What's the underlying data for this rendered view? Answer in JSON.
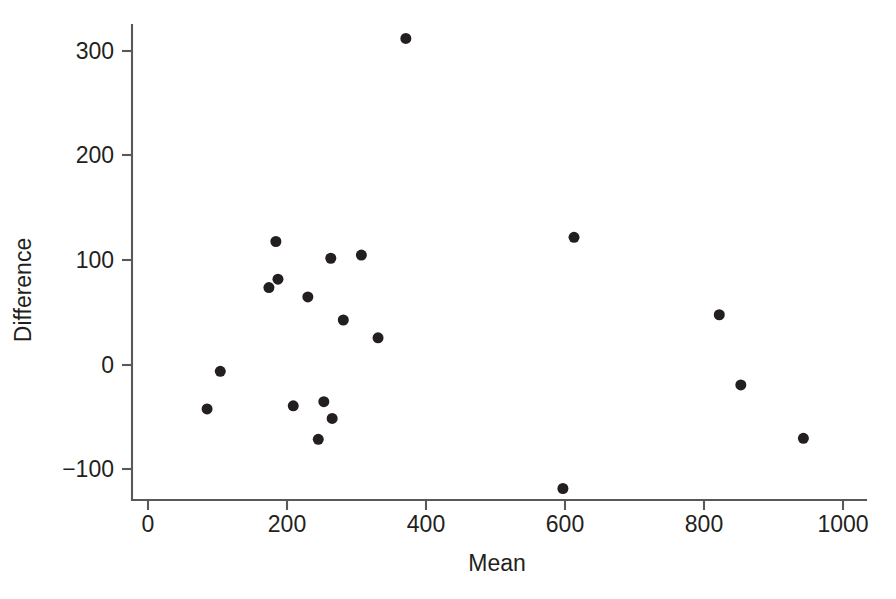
{
  "chart_data": {
    "type": "scatter",
    "title": "",
    "xlabel": "Mean",
    "ylabel": "Difference",
    "xlim": [
      -20,
      1060
    ],
    "ylim": [
      -145,
      330
    ],
    "grid": false,
    "legend": null,
    "x_ticks": [
      0,
      200,
      400,
      600,
      800,
      1000
    ],
    "x_tick_labels": [
      "0",
      "200",
      "400",
      "600",
      "800",
      "1000"
    ],
    "y_ticks": [
      -100,
      0,
      100,
      200,
      300
    ],
    "y_tick_labels": [
      "−100",
      "0",
      "100",
      "200",
      "300"
    ],
    "marker": "filled-circle",
    "marker_color": "#231f20",
    "marker_size": 11,
    "n_points": 20,
    "points": [
      {
        "x": 371,
        "y": 312
      },
      {
        "x": 613,
        "y": 122
      },
      {
        "x": 184,
        "y": 118
      },
      {
        "x": 307,
        "y": 105
      },
      {
        "x": 263,
        "y": 102
      },
      {
        "x": 187,
        "y": 82
      },
      {
        "x": 174,
        "y": 74
      },
      {
        "x": 230,
        "y": 65
      },
      {
        "x": 822,
        "y": 48
      },
      {
        "x": 281,
        "y": 43
      },
      {
        "x": 331,
        "y": 26
      },
      {
        "x": 104,
        "y": -6
      },
      {
        "x": 853,
        "y": -19
      },
      {
        "x": 253,
        "y": -35
      },
      {
        "x": 209,
        "y": -39
      },
      {
        "x": 85,
        "y": -42
      },
      {
        "x": 265,
        "y": -51
      },
      {
        "x": 245,
        "y": -71
      },
      {
        "x": 943,
        "y": -70
      },
      {
        "x": 597,
        "y": -118
      }
    ]
  },
  "figure": {
    "background_color": "#ffffff",
    "axis_color": "#58595b",
    "text_color": "#231f20"
  }
}
